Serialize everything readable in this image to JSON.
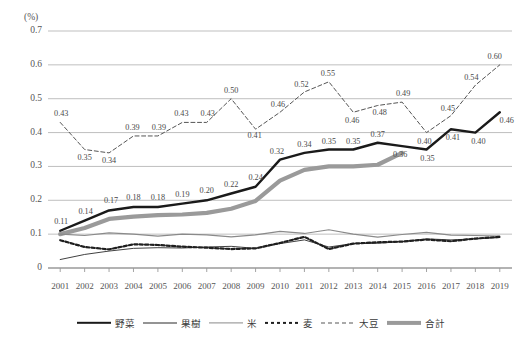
{
  "chart_data": {
    "type": "line",
    "title": "",
    "xlabel": "",
    "ylabel": "(%)",
    "unit_label": "(%)",
    "ylim": [
      0,
      0.7
    ],
    "yticks": [
      "0",
      "0.1",
      "0.2",
      "0.3",
      "0.4",
      "0.5",
      "0.6",
      "0.7"
    ],
    "ytick_values": [
      0,
      0.1,
      0.2,
      0.3,
      0.4,
      0.5,
      0.6,
      0.7
    ],
    "grid": true,
    "legend_position": "bottom",
    "categories": [
      "2001",
      "2002",
      "2003",
      "2004",
      "2005",
      "2006",
      "2007",
      "2008",
      "2009",
      "2010",
      "2011",
      "2012",
      "2013",
      "2014",
      "2015",
      "2016",
      "2017",
      "2018",
      "2019"
    ],
    "series": [
      {
        "name": "野菜",
        "style": "solid-thick-black",
        "color": "#1a1a1a",
        "labelled": true,
        "values": [
          0.11,
          0.14,
          0.17,
          0.18,
          0.18,
          0.19,
          0.2,
          0.22,
          0.24,
          0.32,
          0.34,
          0.35,
          0.35,
          0.37,
          0.36,
          0.35,
          0.41,
          0.4,
          0.46
        ],
        "data_labels": [
          "0.11",
          "0.14",
          "0.17",
          "0.18",
          "0.18",
          "0.19",
          "0.20",
          "0.22",
          "0.24",
          "0.32",
          "0.34",
          "0.35",
          "0.35",
          "0.37",
          "0.36",
          "0.35",
          "0.41",
          "0.40",
          "0.46"
        ]
      },
      {
        "name": "果樹",
        "style": "solid-thin-black",
        "color": "#2b2b2b",
        "labelled": false,
        "values": [
          0.025,
          0.04,
          0.05,
          0.058,
          0.06,
          0.059,
          0.062,
          0.064,
          0.058,
          0.072,
          0.083,
          0.062,
          0.072,
          0.073,
          0.078,
          0.086,
          0.083,
          0.086,
          0.09
        ]
      },
      {
        "name": "米",
        "style": "solid-thin-gray",
        "color": "#8a8a8a",
        "labelled": false,
        "values": [
          0.1,
          0.096,
          0.104,
          0.1,
          0.094,
          0.1,
          0.098,
          0.092,
          0.098,
          0.108,
          0.102,
          0.113,
          0.1,
          0.091,
          0.099,
          0.105,
          0.097,
          0.096,
          0.094
        ]
      },
      {
        "name": "麦",
        "style": "dashed-thick-black",
        "color": "#1f1f1f",
        "labelled": false,
        "values": [
          0.082,
          0.062,
          0.055,
          0.07,
          0.068,
          0.063,
          0.06,
          0.056,
          0.058,
          0.074,
          0.092,
          0.056,
          0.072,
          0.076,
          0.078,
          0.084,
          0.079,
          0.087,
          0.092
        ]
      },
      {
        "name": "大豆",
        "style": "dashed-thin-gray",
        "color": "#555555",
        "labelled": true,
        "values": [
          0.43,
          0.35,
          0.34,
          0.39,
          0.39,
          0.43,
          0.43,
          0.5,
          0.41,
          0.46,
          0.52,
          0.55,
          0.46,
          0.48,
          0.49,
          0.4,
          0.45,
          0.54,
          0.6
        ],
        "data_labels": [
          "0.43",
          "0.35",
          "0.34",
          "0.39",
          "0.39",
          "0.43",
          "0.43",
          "0.50",
          "0.41",
          "0.46",
          "0.52",
          "0.55",
          "0.46",
          "0.48",
          "0.49",
          "0.40",
          "0.45",
          "0.54",
          "0.60"
        ]
      },
      {
        "name": "合計",
        "style": "solid-thick-gray",
        "color": "#9a9a9a",
        "labelled": false,
        "values": [
          0.1,
          0.118,
          0.145,
          0.152,
          0.156,
          0.158,
          0.163,
          0.175,
          0.198,
          0.258,
          0.29,
          0.3,
          0.3,
          0.305,
          0.34,
          null,
          null,
          null,
          null
        ]
      }
    ],
    "legend": [
      {
        "name": "野菜",
        "style": "solid-thick-black"
      },
      {
        "name": "果樹",
        "style": "solid-thin-black"
      },
      {
        "name": "米",
        "style": "solid-thin-gray"
      },
      {
        "name": "麦",
        "style": "dashed-thick-black"
      },
      {
        "name": "大豆",
        "style": "dashed-thin-gray"
      },
      {
        "name": "合計",
        "style": "solid-thick-gray"
      }
    ]
  }
}
